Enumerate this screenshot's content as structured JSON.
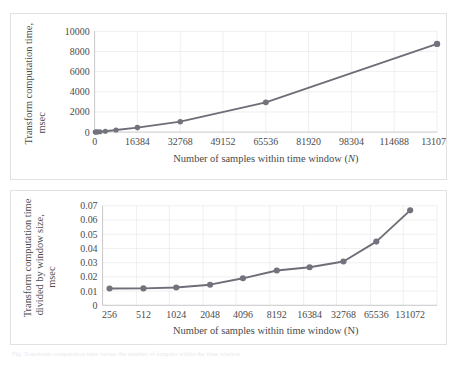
{
  "page": {
    "caption_faint": "Fig. Transform computation time versus the number of samples within the time window"
  },
  "colors": {
    "series": "#6e6e78",
    "marker": "#73737d",
    "grid": "#e8e8ea",
    "axis": "#b9b9bd",
    "text": "#4a4a4a",
    "panel_border": "#e2e2e4"
  },
  "chart_data": [
    {
      "id": "transform-computation-time",
      "type": "line",
      "title": "",
      "xlabel": "Number of samples within time window (N)",
      "xlabel_italic_suffix": "N",
      "ylabel": "Transform computation time, msec",
      "ylabel_line1": "Transform computation time,",
      "ylabel_line2": "msec",
      "xscale": "linear",
      "xlim": [
        0,
        131072
      ],
      "ylim": [
        0,
        10000
      ],
      "xticks": [
        0,
        16384,
        32768,
        49152,
        65536,
        81920,
        98304,
        114688,
        131072
      ],
      "xtick_labels": [
        "0",
        "16384",
        "32768",
        "49152",
        "65536",
        "81920",
        "98304",
        "114688",
        "131072"
      ],
      "yticks": [
        0,
        2000,
        4000,
        6000,
        8000,
        10000
      ],
      "ytick_labels": [
        "0",
        "2000",
        "4000",
        "6000",
        "8000",
        "10000"
      ],
      "grid": true,
      "legend": "none",
      "x": [
        256,
        512,
        1024,
        2048,
        4096,
        8192,
        16384,
        32768,
        65536,
        131072
      ],
      "values": [
        3,
        6,
        13,
        30,
        78,
        204,
        442,
        1030,
        2950,
        8750
      ]
    },
    {
      "id": "transform-time-per-window-size",
      "type": "line",
      "title": "",
      "xlabel": "Number of samples within time window (N)",
      "ylabel": "Transform computation time divided by window size, msec",
      "ylabel_line1": "Transform computation time",
      "ylabel_line2": "divided by window size,",
      "ylabel_line3": "msec",
      "xscale": "categorical",
      "ylim": [
        0,
        0.07
      ],
      "categories": [
        "256",
        "512",
        "1024",
        "2048",
        "4096",
        "8192",
        "16384",
        "32768",
        "65536",
        "131072"
      ],
      "yticks": [
        0,
        0.01,
        0.02,
        0.03,
        0.04,
        0.05,
        0.06,
        0.07
      ],
      "ytick_labels": [
        "0",
        "0.01",
        "0.02",
        "0.03",
        "0.04",
        "0.05",
        "0.06",
        "0.07"
      ],
      "grid": true,
      "legend": "none",
      "values": [
        0.0118,
        0.0119,
        0.0125,
        0.0145,
        0.019,
        0.0245,
        0.0268,
        0.0308,
        0.0448,
        0.0668
      ]
    }
  ]
}
